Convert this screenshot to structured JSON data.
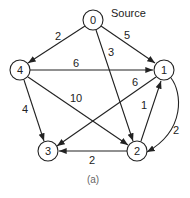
{
  "diagram": {
    "type": "directed-weighted-graph",
    "source_label": "Source",
    "caption": "(a)",
    "nodes": [
      {
        "id": "0",
        "label": "0",
        "x": 93,
        "y": 20
      },
      {
        "id": "1",
        "label": "1",
        "x": 164,
        "y": 70
      },
      {
        "id": "2",
        "label": "2",
        "x": 137,
        "y": 151
      },
      {
        "id": "3",
        "label": "3",
        "x": 48,
        "y": 151
      },
      {
        "id": "4",
        "label": "4",
        "x": 20,
        "y": 70
      }
    ],
    "edges": [
      {
        "from": "0",
        "to": "4",
        "weight": "2"
      },
      {
        "from": "0",
        "to": "1",
        "weight": "5"
      },
      {
        "from": "0",
        "to": "2",
        "weight": "3"
      },
      {
        "from": "4",
        "to": "1",
        "weight": "6"
      },
      {
        "from": "4",
        "to": "2",
        "weight": "10"
      },
      {
        "from": "4",
        "to": "3",
        "weight": "4"
      },
      {
        "from": "1",
        "to": "3",
        "weight": "6"
      },
      {
        "from": "2",
        "to": "1",
        "weight": "1"
      },
      {
        "from": "1",
        "to": "2",
        "weight": "2"
      },
      {
        "from": "2",
        "to": "3",
        "weight": "2"
      }
    ]
  }
}
